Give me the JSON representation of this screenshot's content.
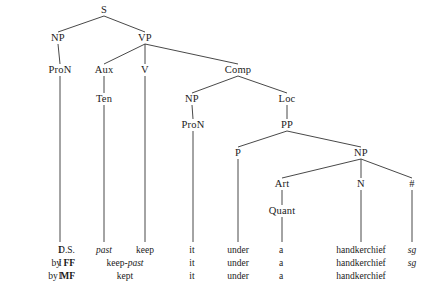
{
  "figure": {
    "type": "syntax-tree",
    "line_color": "#333333",
    "text_color": "#1a1a1a",
    "background": "#ffffff"
  },
  "tree": {
    "nodes": [
      {
        "id": "S",
        "label": "S",
        "x": 104,
        "y": 10
      },
      {
        "id": "NP1",
        "label": "NP",
        "x": 58,
        "y": 38
      },
      {
        "id": "VP",
        "label": "VP",
        "x": 145,
        "y": 38
      },
      {
        "id": "ProN1",
        "label": "ProN",
        "x": 60,
        "y": 70
      },
      {
        "id": "Aux",
        "label": "Aux",
        "x": 104,
        "y": 70
      },
      {
        "id": "V",
        "label": "V",
        "x": 145,
        "y": 70
      },
      {
        "id": "Comp",
        "label": "Comp",
        "x": 238,
        "y": 70
      },
      {
        "id": "Ten",
        "label": "Ten",
        "x": 104,
        "y": 99
      },
      {
        "id": "NP2",
        "label": "NP",
        "x": 192,
        "y": 99
      },
      {
        "id": "Loc",
        "label": "Loc",
        "x": 287,
        "y": 99
      },
      {
        "id": "ProN2",
        "label": "ProN",
        "x": 193,
        "y": 125
      },
      {
        "id": "PP",
        "label": "PP",
        "x": 287,
        "y": 125
      },
      {
        "id": "P",
        "label": "P",
        "x": 238,
        "y": 153
      },
      {
        "id": "NP3",
        "label": "NP",
        "x": 361,
        "y": 153
      },
      {
        "id": "Art",
        "label": "Art",
        "x": 282,
        "y": 184
      },
      {
        "id": "N",
        "label": "N",
        "x": 361,
        "y": 184
      },
      {
        "id": "Num",
        "label": "#",
        "x": 412,
        "y": 184
      },
      {
        "id": "Quant",
        "label": "Quant",
        "x": 282,
        "y": 211
      }
    ],
    "edges": [
      {
        "from": "S",
        "to": "NP1"
      },
      {
        "from": "S",
        "to": "VP"
      },
      {
        "from": "NP1",
        "to": "ProN1"
      },
      {
        "from": "VP",
        "to": "Aux"
      },
      {
        "from": "VP",
        "to": "V"
      },
      {
        "from": "VP",
        "to": "Comp"
      },
      {
        "from": "Aux",
        "to": "Ten"
      },
      {
        "from": "Comp",
        "to": "NP2"
      },
      {
        "from": "Comp",
        "to": "Loc"
      },
      {
        "from": "NP2",
        "to": "ProN2"
      },
      {
        "from": "Loc",
        "to": "PP"
      },
      {
        "from": "PP",
        "to": "P"
      },
      {
        "from": "PP",
        "to": "NP3"
      },
      {
        "from": "NP3",
        "to": "Art"
      },
      {
        "from": "NP3",
        "to": "N"
      },
      {
        "from": "NP3",
        "to": "Num"
      },
      {
        "from": "Art",
        "to": "Quant"
      }
    ],
    "leg_drops": [
      {
        "node": "ProN1",
        "x": 60,
        "from_y": 76,
        "to_y": 242
      },
      {
        "node": "Ten",
        "x": 104,
        "from_y": 105,
        "to_y": 242
      },
      {
        "node": "V",
        "x": 145,
        "from_y": 76,
        "to_y": 242
      },
      {
        "node": "ProN2",
        "x": 193,
        "from_y": 131,
        "to_y": 242
      },
      {
        "node": "P",
        "x": 238,
        "from_y": 159,
        "to_y": 242
      },
      {
        "node": "Quant",
        "x": 282,
        "from_y": 217,
        "to_y": 242
      },
      {
        "node": "N",
        "x": 361,
        "from_y": 190,
        "to_y": 242
      },
      {
        "node": "Num",
        "x": 412,
        "from_y": 190,
        "to_y": 242
      }
    ]
  },
  "derivation": {
    "row_label_right_x": 75,
    "rows": [
      {
        "id": "ds",
        "label_plain": "D.S.",
        "label_bold": "",
        "y": 246,
        "cells": [
          {
            "text": "I",
            "x": 60,
            "italic": false
          },
          {
            "text": "past",
            "x": 104,
            "italic": true
          },
          {
            "text": "keep",
            "x": 145,
            "italic": false
          },
          {
            "text": "it",
            "x": 192,
            "italic": false
          },
          {
            "text": "under",
            "x": 238,
            "italic": false
          },
          {
            "text": "a",
            "x": 281,
            "italic": false
          },
          {
            "text": "handkerchief",
            "x": 361,
            "italic": false
          },
          {
            "text": "sg",
            "x": 412,
            "italic": true
          }
        ]
      },
      {
        "id": "ff",
        "label_plain": "by",
        "label_bold": "FF",
        "y": 259,
        "cells": [
          {
            "text": "I",
            "x": 60,
            "italic": false
          },
          {
            "text": "keep-past",
            "x": 125,
            "italic": false,
            "mixed": "keep-past"
          },
          {
            "text": "it",
            "x": 192,
            "italic": false
          },
          {
            "text": "under",
            "x": 238,
            "italic": false
          },
          {
            "text": "a",
            "x": 281,
            "italic": false
          },
          {
            "text": "handkerchief",
            "x": 361,
            "italic": false
          },
          {
            "text": "sg",
            "x": 412,
            "italic": true
          }
        ]
      },
      {
        "id": "mf",
        "label_plain": "by",
        "label_bold": "MF",
        "y": 272,
        "cells": [
          {
            "text": "I",
            "x": 60,
            "italic": false
          },
          {
            "text": "kept",
            "x": 125,
            "italic": false
          },
          {
            "text": "it",
            "x": 192,
            "italic": false
          },
          {
            "text": "under",
            "x": 238,
            "italic": false
          },
          {
            "text": "a",
            "x": 281,
            "italic": false
          },
          {
            "text": "handkerchief",
            "x": 361,
            "italic": false
          }
        ]
      }
    ]
  }
}
